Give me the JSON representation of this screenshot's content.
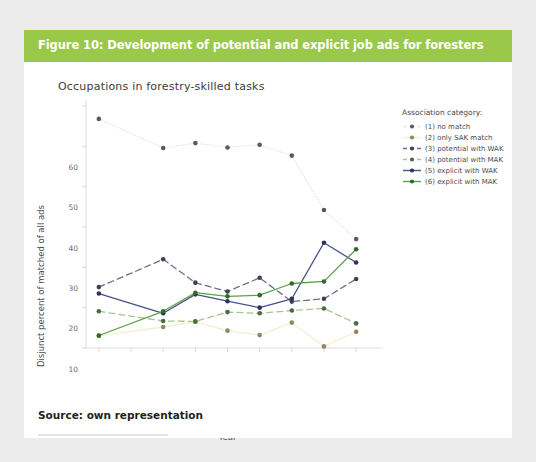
{
  "banner": {
    "title": "Figure 10: Development of potential and explicit job ads for foresters",
    "color": "#9ac94a"
  },
  "footer": {
    "source": "Source: own representation"
  },
  "chart_data": {
    "type": "line",
    "title": "Occupations in forestry-skilled tasks",
    "xlabel": "Year",
    "ylabel": "Disjunct percent of matched of all ads",
    "legend_title": "Association category:",
    "legend_position": "right",
    "grid": false,
    "categories": [
      "2011",
      "2012",
      "2013",
      "2014",
      "2015",
      "2016",
      "2017",
      "2018",
      "2019"
    ],
    "x": [
      2011,
      2012,
      2013,
      2014,
      2015,
      2016,
      2017,
      2018,
      2019
    ],
    "xlim": [
      2010.6,
      2019.4
    ],
    "ylim": [
      0,
      60
    ],
    "yticks": [
      0,
      10,
      20,
      30,
      40,
      50,
      60
    ],
    "series": [
      {
        "name": "(1) no match",
        "values": [
          56.8,
          null,
          49.6,
          50.8,
          49.7,
          50.4,
          47.7,
          34.2,
          27.0
        ],
        "color": "#eeeade",
        "dash": "1,2",
        "marker_color": "#555a63"
      },
      {
        "name": "(2) only SAK match",
        "values": [
          3.0,
          null,
          5.2,
          6.5,
          4.3,
          3.2,
          6.3,
          0.4,
          4.0
        ],
        "color": "#f2efd2",
        "dash": "none",
        "marker_color": "#8d8a5e"
      },
      {
        "name": "(3) potential with WAK",
        "values": [
          15.1,
          null,
          22.0,
          16.2,
          14.0,
          17.4,
          11.5,
          12.2,
          17.1
        ],
        "color": "#6c6f8e",
        "dash": "6,4",
        "marker_color": "#3f4250"
      },
      {
        "name": "(4) potential with MAK",
        "values": [
          9.1,
          null,
          6.7,
          6.6,
          8.9,
          8.6,
          9.3,
          9.8,
          6.1
        ],
        "color": "#a9c58f",
        "dash": "6,4",
        "marker_color": "#4d6b42"
      },
      {
        "name": "(5) explicit with WAK",
        "values": [
          13.5,
          null,
          8.6,
          13.3,
          11.6,
          10.0,
          12.2,
          26.1,
          21.2
        ],
        "color": "#4a4e8c",
        "dash": "none",
        "marker_color": "#2f3360"
      },
      {
        "name": "(6) explicit with MAK",
        "values": [
          3.1,
          null,
          9.1,
          13.7,
          12.8,
          13.1,
          16.0,
          16.5,
          24.5
        ],
        "color": "#5aa24a",
        "dash": "none",
        "marker_color": "#2f6b2a"
      }
    ]
  }
}
